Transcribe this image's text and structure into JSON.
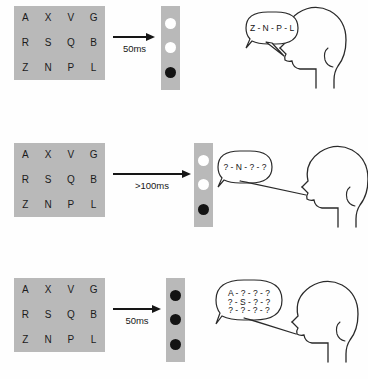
{
  "figure": {
    "grid_bg_color": "#b9b9b9",
    "dot_white_color": "#ffffff",
    "dot_black_color": "#131313",
    "stroke_color": "#161616"
  },
  "letter_matrix": {
    "rows": [
      [
        "A",
        "X",
        "V",
        "G"
      ],
      [
        "R",
        "S",
        "Q",
        "B"
      ],
      [
        "Z",
        "N",
        "P",
        "L"
      ]
    ]
  },
  "trials": [
    {
      "name": "trial-1",
      "duration_label": "50ms",
      "cue_dots": [
        "white",
        "white",
        "black"
      ],
      "report_lines": [
        "Z - N - P - L"
      ]
    },
    {
      "name": "trial-2",
      "duration_label": ">100ms",
      "cue_dots": [
        "white",
        "white",
        "black"
      ],
      "report_lines": [
        "? - N - ? - ?"
      ]
    },
    {
      "name": "trial-3",
      "duration_label": "50ms",
      "cue_dots": [
        "black",
        "black",
        "black"
      ],
      "report_lines": [
        "A - ? - ? - ?",
        "? - S - ? - ?",
        "? - ? - ? - ?"
      ]
    }
  ]
}
